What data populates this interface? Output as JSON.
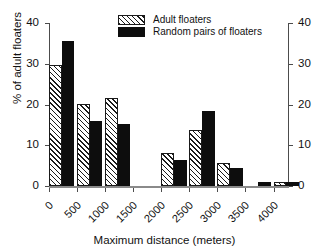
{
  "chart_data": {
    "type": "bar",
    "title": "",
    "xlabel": "Maximum distance (meters)",
    "ylabel": "% of adult floaters",
    "categories": [
      "0",
      "500",
      "1000",
      "1500",
      "2000",
      "2500",
      "3000",
      "3500",
      "4000"
    ],
    "xtick_labels": [
      "0",
      "500",
      "1000",
      "1500",
      "2000",
      "2500",
      "3000",
      "3500",
      "4000"
    ],
    "ytick_labels": [
      "0",
      "10",
      "20",
      "30",
      "40"
    ],
    "ytick_values": [
      0,
      10,
      20,
      30,
      40
    ],
    "ylim": [
      0,
      40
    ],
    "grid": false,
    "legend_position": "top-center",
    "right_axis": true,
    "series": [
      {
        "name": "Adult floaters",
        "fill": "hatched",
        "color": "#1a1a1a",
        "values": [
          29.7,
          20.1,
          21.5,
          0,
          8.0,
          13.8,
          5.6,
          0,
          1.0
        ]
      },
      {
        "name": "Random pairs of floaters",
        "fill": "solid",
        "color": "#0d0d0d",
        "values": [
          35.5,
          15.9,
          15.3,
          0,
          6.4,
          18.3,
          4.3,
          1.0,
          1.0
        ]
      }
    ],
    "bars": [
      {
        "bin": "0",
        "adult_floaters": 29.7,
        "random_pairs": 35.5
      },
      {
        "bin": "500",
        "adult_floaters": 20.1,
        "random_pairs": 15.9
      },
      {
        "bin": "1000",
        "adult_floaters": 21.5,
        "random_pairs": 15.3
      },
      {
        "bin": "1500",
        "adult_floaters": 8.0,
        "random_pairs": 6.4
      },
      {
        "bin": "2000",
        "adult_floaters": 13.8,
        "random_pairs": 18.3
      },
      {
        "bin": "2500",
        "adult_floaters": 5.6,
        "random_pairs": 4.3
      },
      {
        "bin": "3000",
        "adult_floaters": 0.0,
        "random_pairs": 1.0
      },
      {
        "bin": "3500",
        "adult_floaters": 1.0,
        "random_pairs": 1.0
      }
    ]
  },
  "axes": {
    "ylabel": "% of adult floaters",
    "xlabel": "Maximum distance (meters)",
    "y_ticks": [
      "0",
      "10",
      "20",
      "30",
      "40"
    ],
    "x_ticks": [
      "0",
      "500",
      "1000",
      "1500",
      "2000",
      "2500",
      "3000",
      "3500",
      "4000"
    ]
  },
  "legend": {
    "items": [
      {
        "label": "Adult floaters",
        "fill": "hatched"
      },
      {
        "label": "Random pairs of floaters",
        "fill": "solid"
      }
    ]
  }
}
